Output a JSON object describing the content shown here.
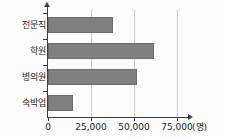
{
  "chart_data": {
    "type": "bar",
    "orientation": "horizontal",
    "title": "",
    "xlabel": "(명)",
    "ylabel": "",
    "categories": [
      "전문직",
      "학원",
      "병의원",
      "숙박업"
    ],
    "values": [
      37800,
      61600,
      51700,
      14500
    ],
    "series": [
      {
        "name": "",
        "values": [
          37800,
          61600,
          51700,
          14500
        ]
      }
    ],
    "xlim": [
      0,
      75000
    ],
    "xticks": [
      0,
      25000,
      50000,
      75000
    ],
    "xtick_labels": [
      "0",
      "25,000",
      "50,000",
      "75,000"
    ],
    "unit": "(명)",
    "grid": true,
    "grid_axis": "x",
    "legend": false,
    "bar_color": "#808080",
    "bar_border_color": "#6b6b6b",
    "axis_color": "#3d3d3d",
    "gridline_color": "#c9c9c9",
    "background_color": "#fdfdfd",
    "text_color": "#1c1c1c"
  }
}
